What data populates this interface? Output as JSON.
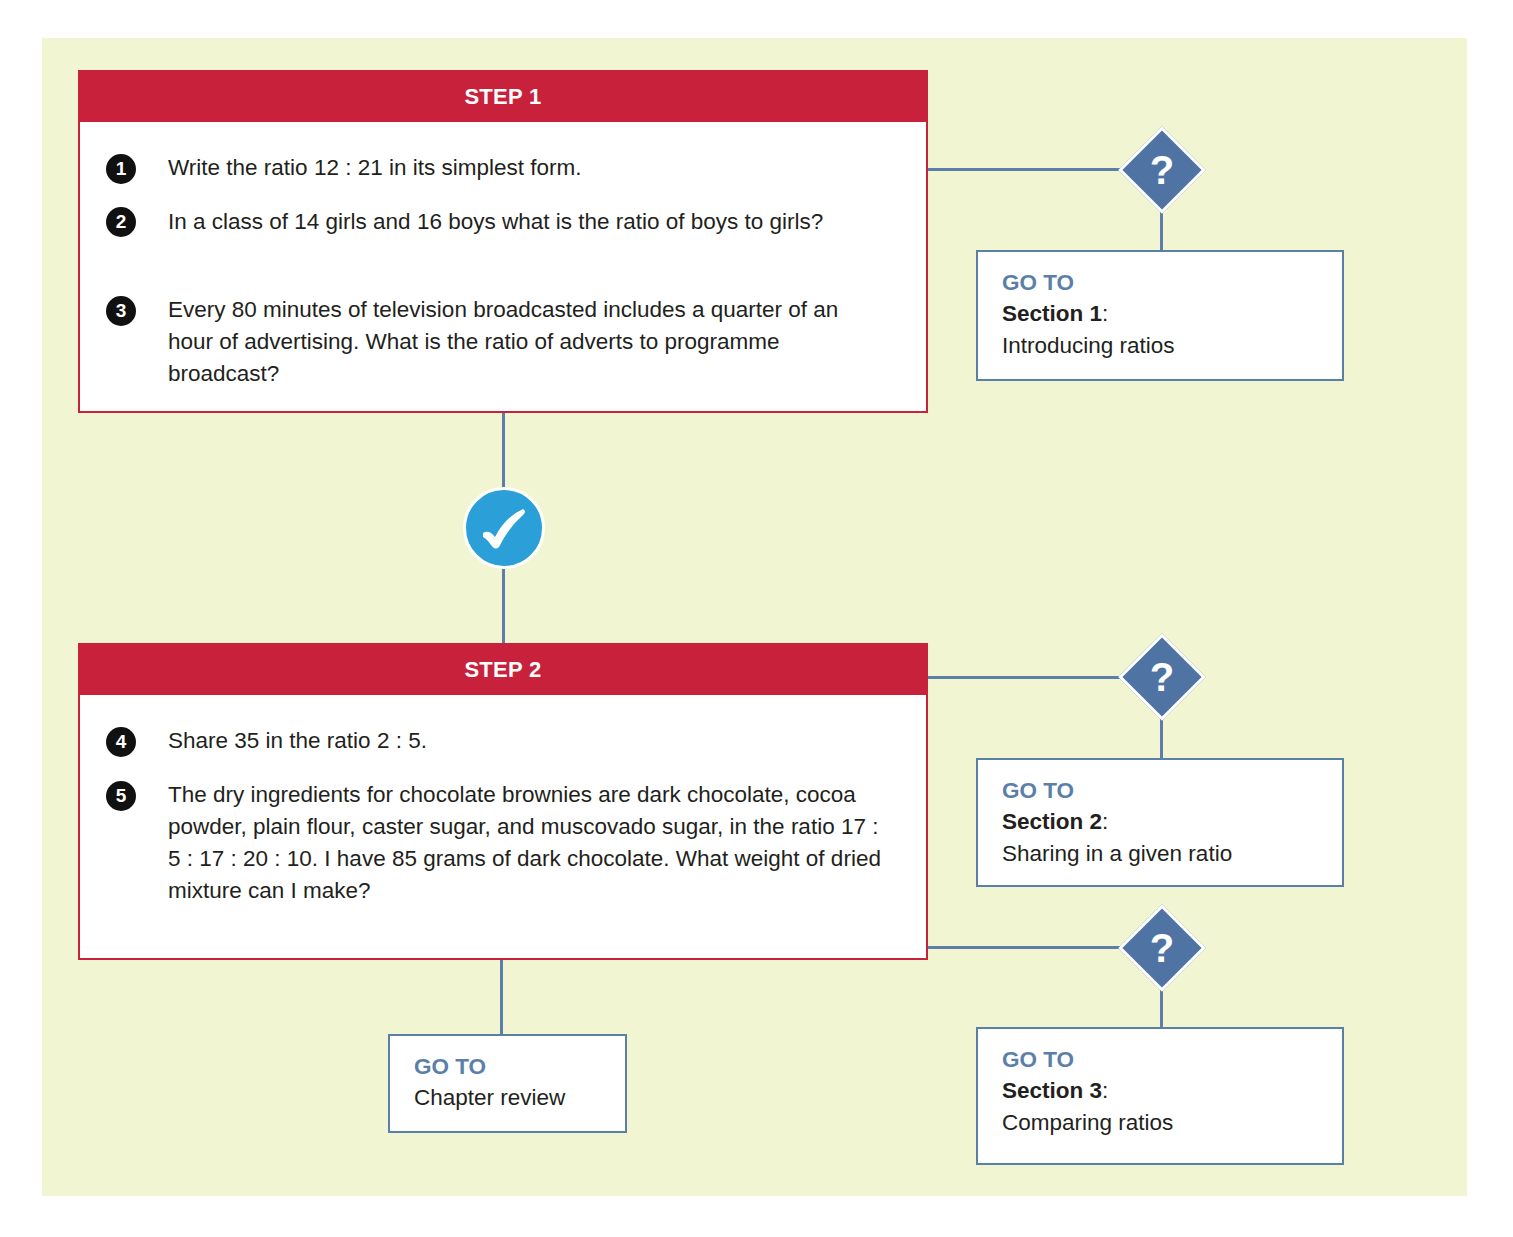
{
  "colors": {
    "panel_background": "#f2f5d2",
    "step_red": "#c8213b",
    "connector_blue": "#5b7fa8",
    "diamond_blue": "#4f74a3",
    "check_blue": "#2a9fd8"
  },
  "steps": [
    {
      "title": "STEP 1",
      "questions": [
        {
          "number": "1",
          "text": "Write the ratio 12 : 21 in its simplest form."
        },
        {
          "number": "2",
          "text": "In a class of 14 girls and 16 boys what is the ratio of boys to girls?"
        },
        {
          "number": "3",
          "text": "Every 80 minutes of television broadcasted includes a quarter of an hour of advertising. What is the ratio of adverts to programme broadcast?"
        }
      ]
    },
    {
      "title": "STEP 2",
      "questions": [
        {
          "number": "4",
          "text": "Share 35 in the ratio 2 : 5."
        },
        {
          "number": "5",
          "text": "The dry ingredients for chocolate brownies are dark chocolate, cocoa powder, plain flour, caster sugar, and muscovado sugar, in the ratio 17 : 5 : 17 : 20 : 10. I have 85 grams of dark chocolate. What weight of dried mixture can I make?"
        }
      ]
    }
  ],
  "decision_icons": {
    "question_mark": "?",
    "check_mark": "✓"
  },
  "goto_boxes": [
    {
      "label": "GO TO",
      "section": "Section 1",
      "separator": ":",
      "title": "Introducing ratios"
    },
    {
      "label": "GO TO",
      "section": "Section 2",
      "separator": ":",
      "title": "Sharing in a given ratio"
    },
    {
      "label": "GO TO",
      "section": "Section 3",
      "separator": ":",
      "title": "Comparing ratios"
    },
    {
      "label": "GO TO",
      "title": "Chapter review"
    }
  ]
}
